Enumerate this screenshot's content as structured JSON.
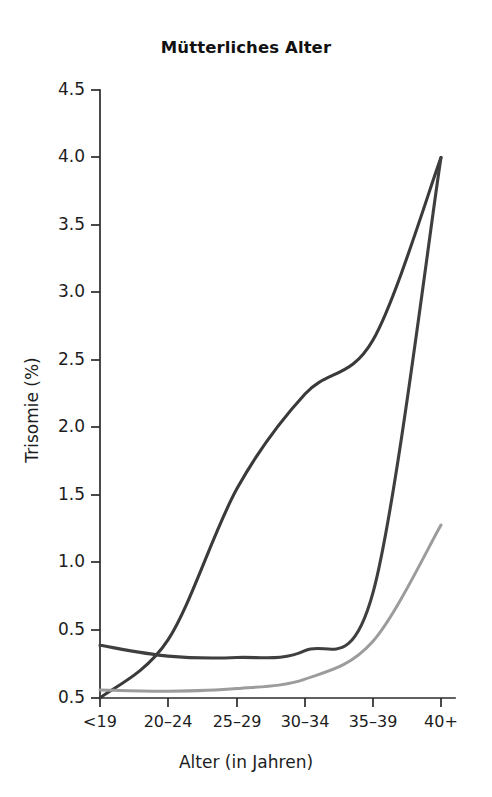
{
  "chart_data": {
    "type": "line",
    "title": "Mütterliches Alter",
    "xlabel": "Alter (in Jahren)",
    "ylabel": "Trisomie (%)",
    "categories": [
      "<19",
      "20–24",
      "25–29",
      "30–34",
      "35–39",
      "40+"
    ],
    "ytick_labels": [
      "4.5",
      "4.0",
      "3.5",
      "3.0",
      "2.5",
      "2.0",
      "1.5",
      "1.0",
      "0.5",
      "0.5"
    ],
    "ytick_values": [
      4.5,
      4.0,
      3.5,
      3.0,
      2.5,
      2.0,
      1.5,
      1.0,
      0.5,
      0.0
    ],
    "ylim": [
      0.0,
      4.5
    ],
    "grid": false,
    "legend": "none",
    "series": [
      {
        "name": "steil-ansteigende-kurve",
        "color": "#3a3a3a",
        "values": [
          0.0,
          0.43,
          1.55,
          2.25,
          2.65,
          4.0
        ]
      },
      {
        "name": "u-foermige-kurve",
        "color": "#3f3f3f",
        "values": [
          0.39,
          0.31,
          0.3,
          0.35,
          0.78,
          4.0
        ]
      },
      {
        "name": "flach-ansteigende-kurve",
        "color": "#9c9c9c",
        "values": [
          0.06,
          0.05,
          0.07,
          0.14,
          0.42,
          1.28
        ]
      }
    ]
  },
  "axes": {
    "x_tick_positions_px": [
      100,
      168,
      237,
      305,
      373,
      441
    ],
    "y_tick_positions_px": [
      90,
      157,
      225,
      292,
      360,
      427,
      495,
      562,
      630,
      698
    ],
    "plot_left_px": 100,
    "plot_right_px": 455,
    "plot_top_px": 90,
    "plot_bottom_px": 698
  }
}
